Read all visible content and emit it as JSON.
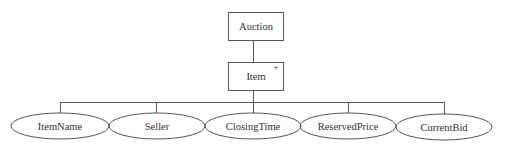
{
  "diagram": {
    "root": {
      "label": "Auction"
    },
    "child": {
      "label": "Item",
      "marker": "+"
    },
    "attributes": [
      {
        "label": "ItemName"
      },
      {
        "label": "Seller"
      },
      {
        "label": "ClosingTime"
      },
      {
        "label": "ReservedPrice"
      },
      {
        "label": "CurrentBid"
      }
    ],
    "colors": {
      "stroke": "#555555",
      "text": "#333333",
      "background": "#ffffff"
    }
  }
}
